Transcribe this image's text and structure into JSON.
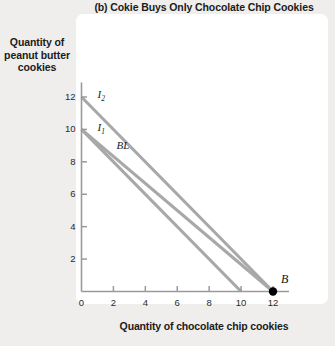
{
  "chart_data": {
    "type": "line",
    "title": "(b) Cokie Buys Only Chocolate Chip Cookies",
    "xlabel": "Quantity of chocolate chip cookies",
    "ylabel": "Quantity of peanut butter cookies",
    "xlim": [
      0,
      13
    ],
    "ylim": [
      0,
      13
    ],
    "xticks": [
      "0",
      "2",
      "4",
      "6",
      "8",
      "10",
      "12"
    ],
    "yticks": [
      "2",
      "4",
      "6",
      "8",
      "10",
      "12"
    ],
    "xtick_values": [
      0,
      2,
      4,
      6,
      8,
      10,
      12
    ],
    "ytick_values": [
      2,
      4,
      6,
      8,
      10,
      12
    ],
    "grid": false,
    "legend": "none",
    "line_color": "#a8a8a8",
    "series": [
      {
        "name": "I2",
        "label": "I",
        "sublabel": "2",
        "points": [
          [
            0,
            12
          ],
          [
            12,
            0
          ]
        ],
        "label_x": 1,
        "label_y": 12.1
      },
      {
        "name": "BL",
        "label": "BL",
        "sublabel": "",
        "points": [
          [
            0,
            10
          ],
          [
            12,
            0
          ]
        ],
        "label_x": 2.2,
        "label_y": 9.0
      },
      {
        "name": "I1",
        "label": "I",
        "sublabel": "1",
        "points": [
          [
            0,
            10
          ],
          [
            10,
            0
          ]
        ],
        "label_x": 1,
        "label_y": 10.1
      }
    ],
    "annotations": [
      {
        "name": "point-B",
        "label": "B",
        "x": 12,
        "y": 0,
        "marker": "filled-circle",
        "color": "#000000"
      }
    ]
  }
}
